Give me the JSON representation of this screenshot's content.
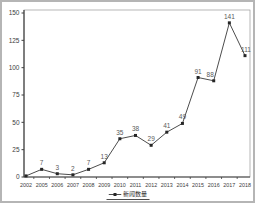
{
  "chart_data": {
    "type": "line",
    "title": "",
    "xlabel": "",
    "ylabel": "",
    "categories": [
      "2002",
      "2005",
      "2006",
      "2007",
      "2008",
      "2009",
      "2010",
      "2011",
      "2012",
      "2013",
      "2014",
      "2015",
      "2016",
      "2017",
      "2018"
    ],
    "series": [
      {
        "name": "新闻数量",
        "values": [
          1,
          7,
          3,
          2,
          7,
          13,
          35,
          38,
          29,
          41,
          49,
          91,
          88,
          141,
          111
        ],
        "point_labels": [
          "",
          "7",
          "3",
          "2",
          "7",
          "13",
          "35",
          "38",
          "29",
          "41",
          "49",
          "91",
          "88",
          "141",
          "111"
        ]
      }
    ],
    "ylim": [
      0,
      150
    ],
    "yticks": [
      "0",
      "25",
      "50",
      "75",
      "100",
      "125",
      "150"
    ],
    "grid": false,
    "legend_position": "bottom",
    "colors": {
      "line": "#4d4d4d",
      "marker": "#262626",
      "data_label": "#595959",
      "tick_label": "#404040",
      "axis": "#404040",
      "plot_border": "#999999",
      "outer_border": "#b5b5b5"
    }
  },
  "legend": {
    "label": "新闻数量",
    "marker": "line-with-square"
  }
}
